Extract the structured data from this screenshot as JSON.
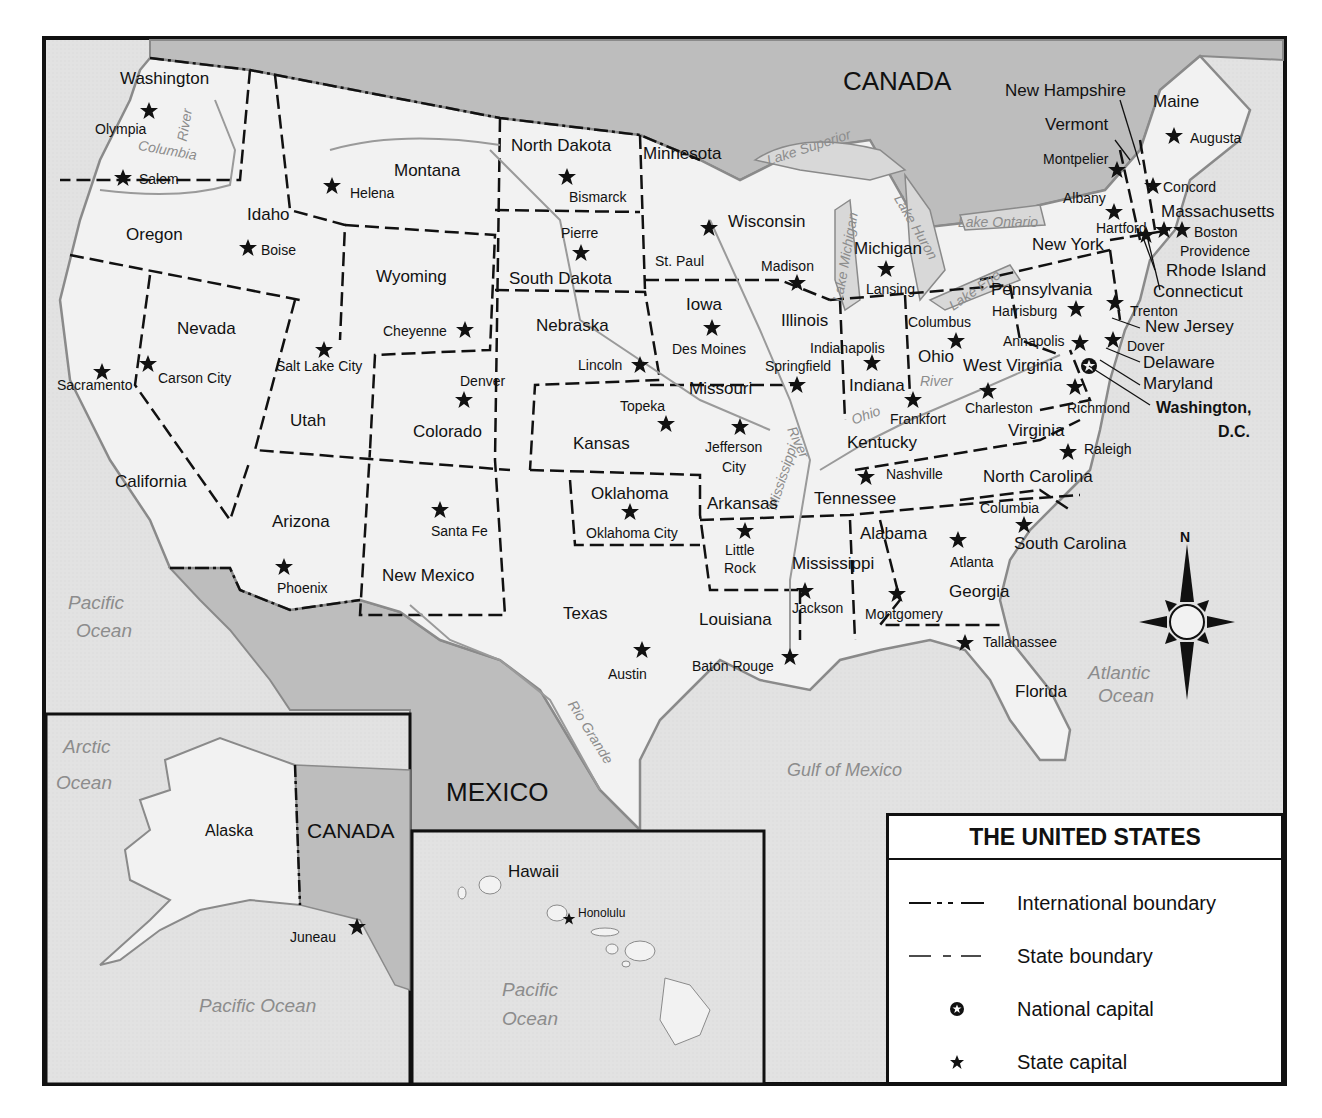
{
  "map": {
    "title": "THE UNITED STATES",
    "colors": {
      "land": "#f0f0f0",
      "water": "#e0e0e0",
      "foreign": "#bdbdbd",
      "outline": "#8a8a8a",
      "ink": "#111111",
      "water_label": "#8c8c8c"
    }
  },
  "countries": {
    "canada": "CANADA",
    "mexico": "MEXICO",
    "canada_inset": "CANADA"
  },
  "water": {
    "pacific": [
      "Pacific",
      "Ocean"
    ],
    "atlantic": [
      "Atlantic",
      "Ocean"
    ],
    "gulf": "Gulf of Mexico",
    "arctic": [
      "Arctic",
      "Ocean"
    ],
    "pacific_alaska": "Pacific Ocean",
    "pacific_hawaii": [
      "Pacific",
      "Ocean"
    ],
    "lakes": [
      "Lake Superior",
      "Lake Michigan",
      "Lake Huron",
      "Lake Ontario",
      "Lake Erie"
    ]
  },
  "rivers": {
    "columbia": "Columbia",
    "columbia_river": "River",
    "mississippi": "Mississippi",
    "mississippi_river": "River",
    "ohio": "Ohio",
    "ohio_river": "River",
    "rio_grande": "Rio Grande"
  },
  "states": {
    "washington": "Washington",
    "oregon": "Oregon",
    "california": "California",
    "idaho": "Idaho",
    "nevada": "Nevada",
    "montana": "Montana",
    "wyoming": "Wyoming",
    "utah": "Utah",
    "colorado": "Colorado",
    "arizona": "Arizona",
    "new_mexico": "New Mexico",
    "north_dakota": "North Dakota",
    "south_dakota": "South Dakota",
    "nebraska": "Nebraska",
    "kansas": "Kansas",
    "oklahoma": "Oklahoma",
    "texas": "Texas",
    "minnesota": "Minnesota",
    "iowa": "Iowa",
    "missouri": "Missouri",
    "arkansas": "Arkansas",
    "louisiana": "Louisiana",
    "wisconsin": "Wisconsin",
    "illinois": "Illinois",
    "michigan": "Michigan",
    "indiana": "Indiana",
    "ohio": "Ohio",
    "kentucky": "Kentucky",
    "tennessee": "Tennessee",
    "mississippi": "Mississippi",
    "alabama": "Alabama",
    "georgia": "Georgia",
    "florida": "Florida",
    "south_carolina": "South Carolina",
    "north_carolina": "North Carolina",
    "virginia": "Virginia",
    "west_virginia": "West Virginia",
    "pennsylvania": "Pennsylvania",
    "new_york": "New York",
    "maine": "Maine",
    "vermont": "Vermont",
    "new_hampshire": "New Hampshire",
    "massachusetts": "Massachusetts",
    "rhode_island": "Rhode Island",
    "connecticut": "Connecticut",
    "new_jersey": "New Jersey",
    "delaware": "Delaware",
    "maryland": "Maryland",
    "alaska": "Alaska",
    "hawaii": "Hawaii"
  },
  "capitals": {
    "olympia": "Olympia",
    "salem": "Salem",
    "sacramento": "Sacramento",
    "boise": "Boise",
    "carson_city": "Carson City",
    "helena": "Helena",
    "cheyenne": "Cheyenne",
    "salt_lake_city": "Salt Lake City",
    "denver": "Denver",
    "phoenix": "Phoenix",
    "santa_fe": "Santa Fe",
    "bismarck": "Bismarck",
    "pierre": "Pierre",
    "lincoln": "Lincoln",
    "topeka": "Topeka",
    "oklahoma_city": "Oklahoma City",
    "austin": "Austin",
    "st_paul": "St. Paul",
    "des_moines": "Des Moines",
    "jefferson_city": [
      "Jefferson",
      "City"
    ],
    "little_rock": [
      "Little",
      "Rock"
    ],
    "baton_rouge": "Baton Rouge",
    "madison": "Madison",
    "springfield": "Springfield",
    "lansing": "Lansing",
    "indianapolis": "Indianapolis",
    "columbus_oh": "Columbus",
    "frankfort": "Frankfort",
    "nashville": "Nashville",
    "jackson": "Jackson",
    "montgomery": "Montgomery",
    "atlanta": "Atlanta",
    "tallahassee": "Tallahassee",
    "columbia_sc": "Columbia",
    "raleigh": "Raleigh",
    "richmond": "Richmond",
    "charleston": "Charleston",
    "harrisburg": "Harrisburg",
    "albany": "Albany",
    "augusta": "Augusta",
    "montpelier": "Montpelier",
    "concord": "Concord",
    "boston": "Boston",
    "providence": "Providence",
    "hartford": "Hartford",
    "trenton": "Trenton",
    "dover": "Dover",
    "annapolis": "Annapolis",
    "juneau": "Juneau",
    "honolulu": "Honolulu"
  },
  "national_capital": {
    "line1": "Washington,",
    "line2": "D.C."
  },
  "compass": {
    "north": "N"
  },
  "legend": {
    "items": [
      {
        "label": "International boundary",
        "symbol": "dash-dot-line"
      },
      {
        "label": "State boundary",
        "symbol": "dashed-line"
      },
      {
        "label": "National capital",
        "symbol": "circle-star"
      },
      {
        "label": "State capital",
        "symbol": "star"
      }
    ]
  }
}
